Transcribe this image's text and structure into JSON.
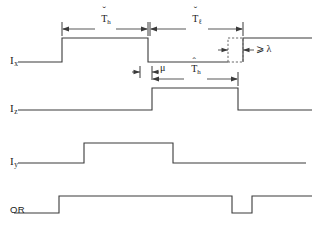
{
  "figure": {
    "type": "timing-diagram",
    "background_color": "#ffffff",
    "line_color": "#3a3a3a",
    "dashed_color": "#6a6a6a",
    "width": 318,
    "height": 230
  },
  "signals": [
    {
      "id": "ix",
      "label_base": "I",
      "label_sub": "x",
      "row_label": "I_x",
      "baseline_y": 62,
      "high_y": 38,
      "transitions": [
        {
          "x": 62,
          "edge": "rise"
        },
        {
          "x": 148,
          "edge": "fall"
        },
        {
          "x": 243,
          "edge": "rise"
        }
      ],
      "start_level": "low",
      "has_dashed_pulse": true
    },
    {
      "id": "iz",
      "label_base": "I",
      "label_sub": "z",
      "row_label": "I_z",
      "baseline_y": 110,
      "high_y": 88,
      "transitions": [
        {
          "x": 152,
          "edge": "rise"
        },
        {
          "x": 238,
          "edge": "fall"
        }
      ],
      "start_level": "low",
      "has_dashed_pulse": false
    },
    {
      "id": "iy",
      "label_base": "I",
      "label_sub": "y",
      "row_label": "I_y",
      "baseline_y": 163,
      "high_y": 143,
      "transitions": [
        {
          "x": 84,
          "edge": "rise"
        },
        {
          "x": 173,
          "edge": "fall"
        }
      ],
      "start_level": "low",
      "has_dashed_pulse": false
    },
    {
      "id": "or",
      "label_base": "OR",
      "label_sub": "",
      "row_label": "OR",
      "baseline_y": 213,
      "high_y": 196,
      "transitions": [
        {
          "x": 59,
          "edge": "rise"
        },
        {
          "x": 232,
          "edge": "fall"
        },
        {
          "x": 252,
          "edge": "rise"
        }
      ],
      "start_level": "low",
      "has_dashed_pulse": false
    }
  ],
  "dimensions": [
    {
      "id": "T-check-h",
      "base": "T",
      "sub": "h",
      "accent": "ˇ",
      "accent_kind": "caron",
      "from_x": 62,
      "to_x": 148,
      "line_y": 29,
      "label_x": 105,
      "label_y": 17,
      "description": "minimum high time"
    },
    {
      "id": "T-check-l",
      "base": "T",
      "sub": "ℓ",
      "accent": "ˇ",
      "accent_kind": "caron",
      "from_x": 150,
      "to_x": 243,
      "line_y": 29,
      "label_x": 196,
      "label_y": 17,
      "description": "minimum low time"
    },
    {
      "id": "mu",
      "base": "μ",
      "sub": "",
      "accent": "",
      "accent_kind": "none",
      "from_x": 140,
      "to_x": 152,
      "line_y": 72,
      "label_x": 159,
      "label_y": 66,
      "description": "propagation delay"
    },
    {
      "id": "T-hat-h",
      "base": "T",
      "sub": "h",
      "accent": "ˆ",
      "accent_kind": "hat",
      "from_x": 152,
      "to_x": 238,
      "line_y": 79,
      "label_x": 195,
      "label_y": 67,
      "description": "actual high time"
    },
    {
      "id": "lambda-pulse",
      "base": "⩾ λ",
      "sub": "",
      "accent": "",
      "accent_kind": "none",
      "from_x": 228,
      "to_x": 243,
      "line_y": 50,
      "label_x": 256,
      "label_y": 45,
      "description": "pulse width at least lambda"
    }
  ],
  "dashed_pulse": {
    "x": 228,
    "y": 38,
    "width": 15,
    "height": 24,
    "label": "⩾ λ"
  },
  "labels": {
    "ix": {
      "text": "I",
      "sub": "x",
      "x": 10,
      "y": 56
    },
    "iz": {
      "text": "I",
      "sub": "z",
      "x": 10,
      "y": 104
    },
    "iy": {
      "text": "I",
      "sub": "y",
      "x": 10,
      "y": 157
    },
    "or": {
      "text": "OR",
      "sub": "",
      "x": 10,
      "y": 206
    }
  },
  "annotations": {
    "lambda_text": "⩾ λ",
    "mu_text": "μ"
  }
}
